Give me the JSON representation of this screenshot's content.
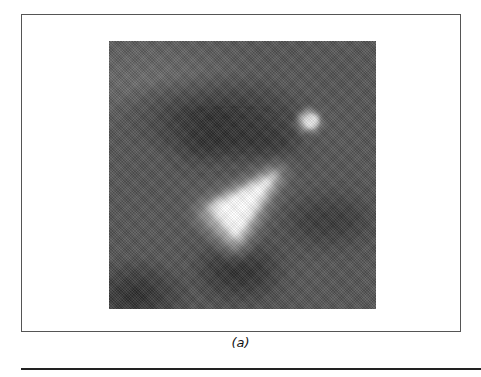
{
  "figure": {
    "panel_label": "(a)",
    "image_description": "grayscale micrograph with bright triangular feature and small bright spot",
    "colors": {
      "frame_border": "#555555",
      "image_background": "#555555",
      "bright_feature": "#f4f4f4",
      "rule": "#222222"
    }
  }
}
